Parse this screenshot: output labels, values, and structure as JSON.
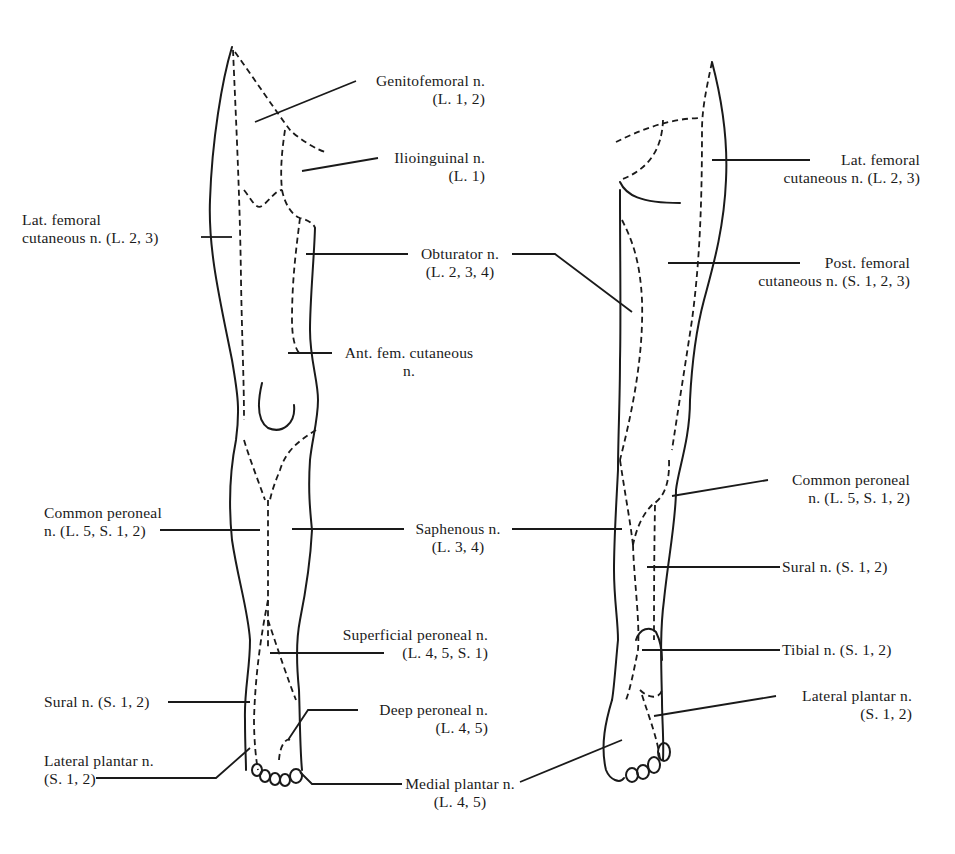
{
  "figure": {
    "views": [
      "anterior",
      "posterior"
    ]
  },
  "anterior_labels": {
    "genitofemoral": {
      "name": "Genitofemoral n.",
      "roots": "(L. 1, 2)"
    },
    "ilioinguinal": {
      "name": "Ilioinguinal n.",
      "roots": "(L. 1)"
    },
    "lat_femoral_cutaneous": {
      "name": "Lat. femoral",
      "roots": "cutaneous n. (L. 2, 3)"
    },
    "obturator": {
      "name": "Obturator n.",
      "roots": "(L. 2, 3, 4)"
    },
    "ant_fem_cutaneous": {
      "name": "Ant. fem. cutaneous",
      "roots": "n."
    },
    "common_peroneal": {
      "name": "Common peroneal",
      "roots": "n.  (L. 5, S. 1, 2)"
    },
    "saphenous": {
      "name": "Saphenous n.",
      "roots": "(L. 3, 4)"
    },
    "superficial_peroneal": {
      "name": "Superficial peroneal n.",
      "roots": "(L. 4, 5, S. 1)"
    },
    "sural": {
      "name": "Sural n. (S. 1, 2)"
    },
    "deep_peroneal": {
      "name": "Deep peroneal n.",
      "roots": "(L. 4, 5)"
    },
    "lateral_plantar": {
      "name": "Lateral plantar n.",
      "roots": "(S. 1, 2)"
    },
    "medial_plantar": {
      "name": "Medial plantar n.",
      "roots": "(L. 4, 5)"
    }
  },
  "posterior_labels": {
    "lat_femoral_cutaneous": {
      "name": "Lat. femoral",
      "roots": "cutaneous n. (L. 2, 3)"
    },
    "post_femoral_cutaneous": {
      "name": "Post. femoral",
      "roots": "cutaneous n. (S. 1, 2, 3)"
    },
    "common_peroneal": {
      "name": "Common peroneal",
      "roots": "n.  (L. 5, S. 1, 2)"
    },
    "sural": {
      "name": "Sural n. (S. 1, 2)"
    },
    "tibial": {
      "name": "Tibial n.  (S. 1, 2)"
    },
    "lateral_plantar": {
      "name": "Lateral plantar n.",
      "roots": "(S. 1, 2)"
    }
  },
  "colors": {
    "ink": "#1a1a1a",
    "background": "#ffffff"
  }
}
